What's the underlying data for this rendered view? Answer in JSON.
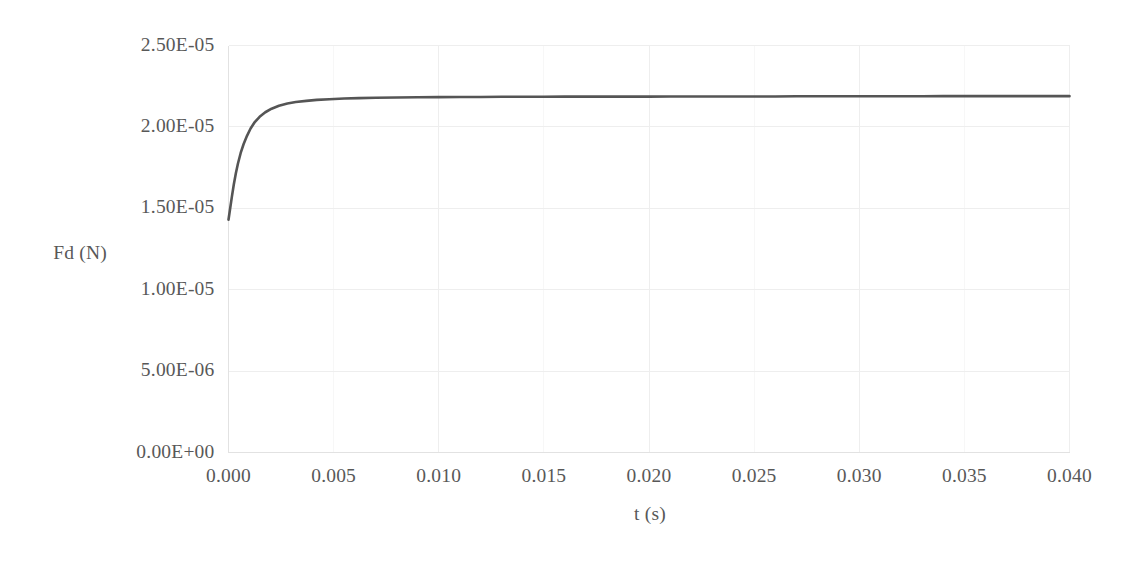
{
  "chart_data": {
    "type": "line",
    "title": "",
    "xlabel": "t (s)",
    "ylabel": "Fd (N)",
    "xlim": [
      0.0,
      0.04
    ],
    "ylim": [
      0.0,
      2.5e-05
    ],
    "grid": true,
    "legend": "none",
    "xticks": [
      "0.000",
      "0.005",
      "0.010",
      "0.015",
      "0.020",
      "0.025",
      "0.030",
      "0.035",
      "0.040"
    ],
    "xtick_values": [
      0.0,
      0.005,
      0.01,
      0.015,
      0.02,
      0.025,
      0.03,
      0.035,
      0.04
    ],
    "yticks": [
      "0.00E+00",
      "5.00E-06",
      "1.00E-05",
      "1.50E-05",
      "2.00E-05",
      "2.50E-05"
    ],
    "ytick_values": [
      0.0,
      5e-06,
      1e-05,
      1.5e-05,
      2e-05,
      2.5e-05
    ],
    "series": [
      {
        "name": "Fd",
        "color": "#555555",
        "x": [
          0.0,
          8e-05,
          0.00016,
          0.00025,
          0.00035,
          0.00045,
          0.00058,
          0.00072,
          0.00088,
          0.00105,
          0.00125,
          0.00148,
          0.00175,
          0.00205,
          0.0024,
          0.0028,
          0.0032,
          0.0037,
          0.0042,
          0.0048,
          0.0055,
          0.0062,
          0.007,
          0.008,
          0.009,
          0.01,
          0.011,
          0.012,
          0.013,
          0.014,
          0.015,
          0.016,
          0.017,
          0.018,
          0.019,
          0.02,
          0.021,
          0.022,
          0.023,
          0.024,
          0.025,
          0.026,
          0.027,
          0.028,
          0.029,
          0.03,
          0.031,
          0.032,
          0.033,
          0.034,
          0.035,
          0.036,
          0.037,
          0.038,
          0.039,
          0.04
        ],
        "y": [
          1.43e-05,
          1.5e-05,
          1.57e-05,
          1.645e-05,
          1.715e-05,
          1.775e-05,
          1.84e-05,
          1.895e-05,
          1.945e-05,
          1.99e-05,
          2.03e-05,
          2.062e-05,
          2.09e-05,
          2.112e-05,
          2.13e-05,
          2.144e-05,
          2.153e-05,
          2.16e-05,
          2.166e-05,
          2.17e-05,
          2.174e-05,
          2.177e-05,
          2.179e-05,
          2.181e-05,
          2.182e-05,
          2.183e-05,
          2.184e-05,
          2.184e-05,
          2.185e-05,
          2.185e-05,
          2.185e-05,
          2.186e-05,
          2.186e-05,
          2.186e-05,
          2.186e-05,
          2.186e-05,
          2.187e-05,
          2.187e-05,
          2.187e-05,
          2.187e-05,
          2.187e-05,
          2.187e-05,
          2.188e-05,
          2.188e-05,
          2.188e-05,
          2.188e-05,
          2.188e-05,
          2.188e-05,
          2.188e-05,
          2.189e-05,
          2.189e-05,
          2.189e-05,
          2.189e-05,
          2.189e-05,
          2.189e-05,
          2.189e-05
        ]
      }
    ],
    "annotations": []
  },
  "style": {
    "plot_border_color": "#e2e2e2",
    "gridline_color": "#eeeeee",
    "curve_color": "#555555",
    "label_color": "#585858",
    "background": "#ffffff"
  }
}
